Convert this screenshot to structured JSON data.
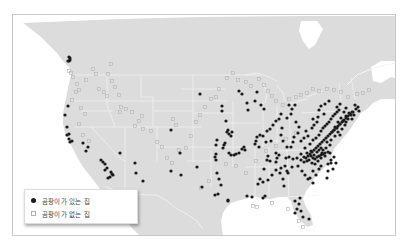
{
  "map": {
    "title": "",
    "colors": {
      "land": "#dcdcdc",
      "water": "#ffffff",
      "borders": "#f4f4f4",
      "with_mold": "#1a1a1a",
      "without_mold_stroke": "#b4b4b4"
    }
  },
  "legend": {
    "items": [
      {
        "label": "곰팡이가 있는 집",
        "marker": "filled-dot"
      },
      {
        "label": "곰팡이가 없는 집",
        "marker": "hollow-square"
      }
    ]
  },
  "points": {
    "with_mold": [
      [
        68,
        56
      ],
      [
        68,
        60
      ],
      [
        67,
        60
      ],
      [
        69,
        57
      ],
      [
        69,
        59
      ],
      [
        67,
        105
      ],
      [
        64,
        114
      ],
      [
        66,
        126
      ],
      [
        68,
        133
      ],
      [
        66,
        134
      ],
      [
        68,
        138
      ],
      [
        71,
        140
      ],
      [
        69,
        141
      ],
      [
        82,
        142
      ],
      [
        87,
        146
      ],
      [
        85,
        150
      ],
      [
        100,
        159
      ],
      [
        102,
        161
      ],
      [
        104,
        163
      ],
      [
        106,
        167
      ],
      [
        104,
        169
      ],
      [
        110,
        171
      ],
      [
        112,
        174
      ],
      [
        107,
        177
      ],
      [
        109,
        176
      ],
      [
        111,
        173
      ],
      [
        119,
        152
      ],
      [
        134,
        162
      ],
      [
        135,
        172
      ],
      [
        142,
        180
      ],
      [
        199,
        93
      ],
      [
        170,
        170
      ],
      [
        180,
        174
      ],
      [
        196,
        166
      ],
      [
        179,
        152
      ],
      [
        170,
        129
      ],
      [
        221,
        105
      ],
      [
        221,
        110
      ],
      [
        225,
        120
      ],
      [
        227,
        129
      ],
      [
        228,
        133
      ],
      [
        226,
        131
      ],
      [
        231,
        131
      ],
      [
        230,
        135
      ],
      [
        216,
        139
      ],
      [
        215,
        144
      ],
      [
        215,
        153
      ],
      [
        214,
        156
      ],
      [
        215,
        159
      ],
      [
        222,
        147
      ],
      [
        223,
        144
      ],
      [
        224,
        142
      ],
      [
        228,
        152
      ],
      [
        230,
        154
      ],
      [
        233,
        154
      ],
      [
        235,
        153
      ],
      [
        238,
        152
      ],
      [
        241,
        148
      ],
      [
        243,
        146
      ],
      [
        244,
        149
      ],
      [
        216,
        172
      ],
      [
        218,
        178
      ],
      [
        220,
        184
      ],
      [
        214,
        194
      ],
      [
        217,
        193
      ],
      [
        227,
        199
      ],
      [
        227,
        200
      ],
      [
        201,
        186
      ],
      [
        246,
        195
      ],
      [
        251,
        196
      ],
      [
        257,
        183
      ],
      [
        259,
        178
      ],
      [
        262,
        181
      ],
      [
        238,
        90
      ],
      [
        241,
        93
      ],
      [
        256,
        91
      ],
      [
        254,
        100
      ],
      [
        260,
        104
      ],
      [
        263,
        108
      ],
      [
        247,
        109
      ],
      [
        246,
        102
      ],
      [
        259,
        134
      ],
      [
        262,
        135
      ],
      [
        256,
        136
      ],
      [
        255,
        140
      ],
      [
        254,
        143
      ],
      [
        258,
        146
      ],
      [
        265,
        141
      ],
      [
        270,
        140
      ],
      [
        267,
        155
      ],
      [
        266,
        159
      ],
      [
        269,
        160
      ],
      [
        275,
        161
      ],
      [
        276,
        157
      ],
      [
        278,
        154
      ],
      [
        275,
        152
      ],
      [
        282,
        140
      ],
      [
        280,
        134
      ],
      [
        281,
        127
      ],
      [
        286,
        117
      ],
      [
        290,
        113
      ],
      [
        291,
        108
      ],
      [
        294,
        104
      ],
      [
        288,
        104
      ],
      [
        295,
        121
      ],
      [
        298,
        126
      ],
      [
        297,
        132
      ],
      [
        293,
        136
      ],
      [
        292,
        141
      ],
      [
        290,
        146
      ],
      [
        286,
        146
      ],
      [
        300,
        140
      ],
      [
        303,
        137
      ],
      [
        307,
        135
      ],
      [
        305,
        130
      ],
      [
        311,
        127
      ],
      [
        313,
        124
      ],
      [
        316,
        121
      ],
      [
        312,
        118
      ],
      [
        303,
        156
      ],
      [
        306,
        152
      ],
      [
        310,
        150
      ],
      [
        313,
        154
      ],
      [
        316,
        151
      ],
      [
        318,
        149
      ],
      [
        320,
        147
      ],
      [
        321,
        152
      ],
      [
        322,
        149
      ],
      [
        325,
        147
      ],
      [
        327,
        151
      ],
      [
        324,
        155
      ],
      [
        320,
        157
      ],
      [
        317,
        160
      ],
      [
        314,
        163
      ],
      [
        311,
        162
      ],
      [
        308,
        159
      ],
      [
        306,
        160
      ],
      [
        303,
        161
      ],
      [
        300,
        159
      ],
      [
        296,
        157
      ],
      [
        292,
        158
      ],
      [
        288,
        156
      ],
      [
        285,
        157
      ],
      [
        284,
        165
      ],
      [
        287,
        172
      ],
      [
        282,
        178
      ],
      [
        283,
        185
      ],
      [
        279,
        172
      ],
      [
        271,
        174
      ],
      [
        267,
        179
      ],
      [
        263,
        168
      ],
      [
        275,
        169
      ],
      [
        280,
        167
      ],
      [
        286,
        170
      ],
      [
        291,
        166
      ],
      [
        297,
        165
      ],
      [
        301,
        170
      ],
      [
        304,
        174
      ],
      [
        309,
        177
      ],
      [
        312,
        170
      ],
      [
        315,
        174
      ],
      [
        318,
        168
      ],
      [
        320,
        165
      ],
      [
        327,
        163
      ],
      [
        330,
        159
      ],
      [
        333,
        156
      ],
      [
        329,
        152
      ],
      [
        326,
        141
      ],
      [
        329,
        144
      ],
      [
        330,
        139
      ],
      [
        334,
        135
      ],
      [
        337,
        131
      ],
      [
        339,
        134
      ],
      [
        341,
        128
      ],
      [
        344,
        124
      ],
      [
        345,
        121
      ],
      [
        347,
        118
      ],
      [
        350,
        114
      ],
      [
        352,
        111
      ],
      [
        355,
        108
      ],
      [
        354,
        104
      ],
      [
        357,
        106
      ],
      [
        358,
        110
      ],
      [
        340,
        117
      ],
      [
        337,
        121
      ],
      [
        334,
        126
      ],
      [
        331,
        131
      ],
      [
        333,
        129
      ],
      [
        336,
        127
      ],
      [
        339,
        123
      ],
      [
        342,
        120
      ],
      [
        345,
        115
      ],
      [
        348,
        112
      ],
      [
        351,
        118
      ],
      [
        353,
        114
      ],
      [
        343,
        111
      ],
      [
        345,
        107
      ],
      [
        336,
        106
      ],
      [
        339,
        103
      ],
      [
        324,
        103
      ],
      [
        328,
        100
      ],
      [
        320,
        105
      ],
      [
        318,
        109
      ],
      [
        323,
        113
      ],
      [
        317,
        116
      ],
      [
        330,
        162
      ],
      [
        335,
        162
      ],
      [
        332,
        168
      ],
      [
        327,
        170
      ],
      [
        326,
        177
      ],
      [
        312,
        182
      ],
      [
        307,
        178
      ],
      [
        294,
        200
      ],
      [
        299,
        197
      ],
      [
        298,
        203
      ],
      [
        296,
        208
      ],
      [
        300,
        210
      ],
      [
        294,
        212
      ],
      [
        302,
        216
      ],
      [
        308,
        218
      ],
      [
        262,
        197
      ],
      [
        264,
        195
      ],
      [
        280,
        113
      ],
      [
        278,
        118
      ],
      [
        275,
        120
      ],
      [
        272,
        124
      ],
      [
        269,
        128
      ],
      [
        266,
        130
      ],
      [
        300,
        153
      ],
      [
        304,
        147
      ],
      [
        309,
        143
      ],
      [
        312,
        139
      ],
      [
        315,
        137
      ],
      [
        318,
        134
      ],
      [
        320,
        130
      ],
      [
        322,
        127
      ],
      [
        324,
        125
      ],
      [
        326,
        123
      ],
      [
        328,
        121
      ],
      [
        330,
        118
      ],
      [
        332,
        115
      ],
      [
        334,
        113
      ],
      [
        336,
        111
      ],
      [
        338,
        109
      ],
      [
        310,
        155
      ],
      [
        312,
        157
      ],
      [
        314,
        158
      ],
      [
        316,
        156
      ],
      [
        318,
        155
      ],
      [
        320,
        154
      ],
      [
        322,
        153
      ],
      [
        324,
        152
      ],
      [
        305,
        157
      ],
      [
        307,
        155
      ],
      [
        309,
        153
      ],
      [
        311,
        151
      ],
      [
        313,
        149
      ],
      [
        315,
        147
      ],
      [
        317,
        145
      ],
      [
        319,
        143
      ],
      [
        321,
        141
      ],
      [
        323,
        139
      ],
      [
        325,
        137
      ],
      [
        327,
        135
      ],
      [
        329,
        133
      ],
      [
        331,
        131
      ],
      [
        333,
        129
      ],
      [
        335,
        127
      ],
      [
        337,
        125
      ],
      [
        339,
        123
      ],
      [
        341,
        121
      ],
      [
        343,
        119
      ],
      [
        345,
        117
      ],
      [
        347,
        115
      ],
      [
        349,
        113
      ],
      [
        351,
        111
      ]
    ],
    "without_mold": [
      [
        72,
        76
      ],
      [
        76,
        83
      ],
      [
        78,
        89
      ],
      [
        75,
        91
      ],
      [
        71,
        99
      ],
      [
        85,
        79
      ],
      [
        92,
        68
      ],
      [
        95,
        73
      ],
      [
        98,
        88
      ],
      [
        103,
        91
      ],
      [
        106,
        95
      ],
      [
        110,
        63
      ],
      [
        107,
        73
      ],
      [
        111,
        80
      ],
      [
        114,
        86
      ],
      [
        118,
        94
      ],
      [
        125,
        108
      ],
      [
        131,
        111
      ],
      [
        134,
        125
      ],
      [
        142,
        128
      ],
      [
        150,
        130
      ],
      [
        156,
        141
      ],
      [
        161,
        146
      ],
      [
        166,
        157
      ],
      [
        171,
        162
      ],
      [
        178,
        149
      ],
      [
        185,
        147
      ],
      [
        190,
        135
      ],
      [
        195,
        121
      ],
      [
        199,
        114
      ],
      [
        204,
        106
      ],
      [
        210,
        98
      ],
      [
        215,
        96
      ],
      [
        218,
        88
      ],
      [
        226,
        77
      ],
      [
        232,
        72
      ],
      [
        237,
        79
      ],
      [
        245,
        81
      ],
      [
        250,
        85
      ],
      [
        258,
        78
      ],
      [
        263,
        84
      ],
      [
        267,
        90
      ],
      [
        271,
        95
      ],
      [
        275,
        100
      ],
      [
        282,
        104
      ],
      [
        288,
        98
      ],
      [
        295,
        96
      ],
      [
        300,
        94
      ],
      [
        306,
        92
      ],
      [
        312,
        88
      ],
      [
        318,
        90
      ],
      [
        326,
        88
      ],
      [
        333,
        89
      ],
      [
        340,
        91
      ],
      [
        347,
        96
      ],
      [
        356,
        93
      ],
      [
        362,
        92
      ],
      [
        368,
        89
      ],
      [
        252,
        205
      ],
      [
        256,
        206
      ],
      [
        271,
        202
      ],
      [
        287,
        208
      ],
      [
        298,
        220
      ],
      [
        302,
        226
      ],
      [
        80,
        107
      ],
      [
        84,
        113
      ],
      [
        78,
        123
      ],
      [
        82,
        134
      ],
      [
        88,
        140
      ],
      [
        200,
        187
      ],
      [
        208,
        180
      ],
      [
        225,
        163
      ],
      [
        235,
        165
      ],
      [
        245,
        172
      ],
      [
        255,
        160
      ],
      [
        265,
        150
      ],
      [
        275,
        145
      ],
      [
        285,
        138
      ],
      [
        295,
        132
      ],
      [
        68,
        70
      ],
      [
        70,
        72
      ],
      [
        120,
        106
      ],
      [
        119,
        111
      ],
      [
        175,
        124
      ],
      [
        172,
        118
      ],
      [
        141,
        115
      ],
      [
        138,
        120
      ]
    ]
  }
}
